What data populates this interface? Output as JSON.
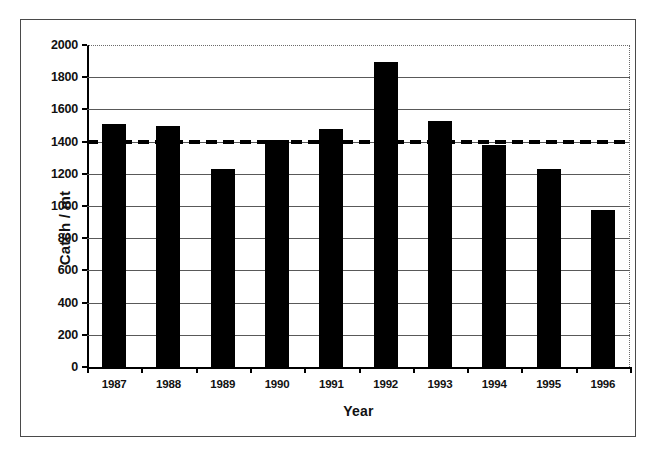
{
  "chart_data": {
    "type": "bar",
    "title": "",
    "xlabel": "Year",
    "ylabel": "Catch / mt",
    "categories": [
      "1987",
      "1988",
      "1989",
      "1990",
      "1991",
      "1992",
      "1993",
      "1994",
      "1995",
      "1996"
    ],
    "values": [
      1510,
      1500,
      1230,
      1410,
      1480,
      1895,
      1530,
      1380,
      1230,
      975
    ],
    "ylim": [
      0,
      2000
    ],
    "ytick_step": 200,
    "yticks": [
      "2000",
      "1800",
      "1600",
      "1400",
      "1200",
      "1000",
      "800",
      "600",
      "400",
      "200",
      "0"
    ],
    "grid": "horizontal",
    "legend": "none",
    "annotations": [
      {
        "name": "reference-line",
        "style": "dashed",
        "orientation": "horizontal",
        "value": 1400,
        "label": ""
      }
    ],
    "colors": {
      "bar": "#000000",
      "grid": "#595959",
      "axis": "#000000",
      "reference_line": "#000000",
      "background": "#ffffff",
      "frame": "#4a4a4a"
    }
  }
}
